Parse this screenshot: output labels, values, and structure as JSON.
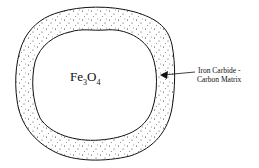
{
  "diagram": {
    "core": {
      "element": "Fe",
      "sub1": "3",
      "element2": "O",
      "sub2": "4"
    },
    "shell_label": {
      "line1": "Iron Carbide -",
      "line2": "Carbon Matrix"
    },
    "colors": {
      "stroke": "#111111",
      "background": "#ffffff"
    }
  }
}
